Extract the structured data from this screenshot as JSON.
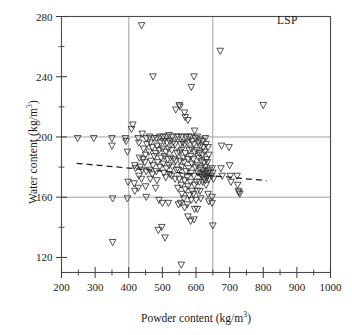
{
  "chart_data": {
    "type": "scatter",
    "title": "",
    "annotation": "LSP",
    "xlabel": "Powder content (kg/m",
    "xlabel_sup": "3",
    "xlabel_tail": ")",
    "ylabel": "Water content (kg/m",
    "ylabel_sup": "3",
    "ylabel_tail": ")",
    "xlim": [
      200,
      1000
    ],
    "ylim": [
      110,
      280
    ],
    "xticks": [
      200,
      300,
      400,
      500,
      600,
      700,
      800,
      900,
      1000
    ],
    "xticklabels": [
      "200",
      "300",
      "400",
      "500",
      "600",
      "700",
      "800",
      "900",
      "1000"
    ],
    "xminor_step": 50,
    "yticks": [
      120,
      160,
      200,
      240,
      280
    ],
    "yticklabels": [
      "120",
      "160",
      "200",
      "240",
      "280"
    ],
    "yminor_step": 20,
    "grid": true,
    "gridlines_x": [
      400,
      650
    ],
    "gridlines_y": [
      160,
      200
    ],
    "grid_color": "#999999",
    "marker": "triangle-down-open",
    "marker_color": "#333333",
    "legend": "none",
    "trendline": {
      "style": "dashed",
      "color": "#1a1a1a",
      "x": [
        245,
        810
      ],
      "y": [
        182.5,
        171.0
      ]
    },
    "points": [
      [
        248,
        199
      ],
      [
        296,
        199
      ],
      [
        350,
        199
      ],
      [
        350,
        194
      ],
      [
        352,
        159
      ],
      [
        352,
        130
      ],
      [
        390,
        199
      ],
      [
        392,
        197
      ],
      [
        396,
        190
      ],
      [
        398,
        170
      ],
      [
        396,
        159
      ],
      [
        408,
        205
      ],
      [
        412,
        208
      ],
      [
        418,
        181
      ],
      [
        420,
        179
      ],
      [
        416,
        169
      ],
      [
        418,
        164
      ],
      [
        428,
        199
      ],
      [
        430,
        196
      ],
      [
        432,
        186
      ],
      [
        434,
        180
      ],
      [
        430,
        174
      ],
      [
        428,
        166
      ],
      [
        438,
        274
      ],
      [
        440,
        202
      ],
      [
        444,
        192
      ],
      [
        442,
        185
      ],
      [
        440,
        178
      ],
      [
        438,
        172
      ],
      [
        452,
        199
      ],
      [
        454,
        195
      ],
      [
        450,
        188
      ],
      [
        448,
        183
      ],
      [
        452,
        177
      ],
      [
        450,
        167
      ],
      [
        452,
        160
      ],
      [
        462,
        200
      ],
      [
        464,
        196
      ],
      [
        460,
        190
      ],
      [
        466,
        184
      ],
      [
        462,
        178
      ],
      [
        464,
        172
      ],
      [
        472,
        240
      ],
      [
        474,
        199
      ],
      [
        470,
        193
      ],
      [
        476,
        187
      ],
      [
        472,
        181
      ],
      [
        470,
        175
      ],
      [
        482,
        199
      ],
      [
        484,
        194
      ],
      [
        480,
        189
      ],
      [
        486,
        183
      ],
      [
        482,
        177
      ],
      [
        484,
        171
      ],
      [
        480,
        166
      ],
      [
        492,
        200
      ],
      [
        494,
        196
      ],
      [
        490,
        191
      ],
      [
        496,
        186
      ],
      [
        492,
        180
      ],
      [
        490,
        158
      ],
      [
        488,
        138
      ],
      [
        502,
        200
      ],
      [
        504,
        197
      ],
      [
        500,
        192
      ],
      [
        506,
        187
      ],
      [
        502,
        182
      ],
      [
        504,
        176
      ],
      [
        500,
        156
      ],
      [
        498,
        140
      ],
      [
        512,
        200
      ],
      [
        514,
        196
      ],
      [
        510,
        190
      ],
      [
        516,
        185
      ],
      [
        512,
        179
      ],
      [
        510,
        173
      ],
      [
        508,
        133
      ],
      [
        520,
        201
      ],
      [
        522,
        197
      ],
      [
        518,
        192
      ],
      [
        524,
        186
      ],
      [
        520,
        181
      ],
      [
        522,
        175
      ],
      [
        518,
        156
      ],
      [
        530,
        200
      ],
      [
        532,
        196
      ],
      [
        528,
        191
      ],
      [
        534,
        185
      ],
      [
        530,
        180
      ],
      [
        528,
        174
      ],
      [
        540,
        218
      ],
      [
        542,
        200
      ],
      [
        538,
        195
      ],
      [
        544,
        189
      ],
      [
        540,
        184
      ],
      [
        542,
        178
      ],
      [
        538,
        172
      ],
      [
        550,
        221
      ],
      [
        552,
        220
      ],
      [
        548,
        200
      ],
      [
        554,
        195
      ],
      [
        550,
        190
      ],
      [
        552,
        184
      ],
      [
        548,
        178
      ],
      [
        550,
        172
      ],
      [
        546,
        166
      ],
      [
        548,
        155
      ],
      [
        558,
        200
      ],
      [
        560,
        196
      ],
      [
        556,
        191
      ],
      [
        562,
        186
      ],
      [
        558,
        180
      ],
      [
        560,
        174
      ],
      [
        556,
        168
      ],
      [
        558,
        162
      ],
      [
        554,
        156
      ],
      [
        556,
        115
      ],
      [
        566,
        216
      ],
      [
        568,
        213
      ],
      [
        570,
        200
      ],
      [
        566,
        195
      ],
      [
        568,
        189
      ],
      [
        564,
        183
      ],
      [
        570,
        177
      ],
      [
        566,
        171
      ],
      [
        568,
        165
      ],
      [
        564,
        159
      ],
      [
        566,
        153
      ],
      [
        576,
        211
      ],
      [
        578,
        200
      ],
      [
        574,
        196
      ],
      [
        580,
        191
      ],
      [
        576,
        185
      ],
      [
        578,
        179
      ],
      [
        574,
        173
      ],
      [
        576,
        167
      ],
      [
        580,
        161
      ],
      [
        574,
        155
      ],
      [
        576,
        147
      ],
      [
        586,
        233
      ],
      [
        584,
        200
      ],
      [
        588,
        197
      ],
      [
        586,
        192
      ],
      [
        584,
        187
      ],
      [
        588,
        182
      ],
      [
        586,
        176
      ],
      [
        584,
        170
      ],
      [
        588,
        164
      ],
      [
        586,
        158
      ],
      [
        584,
        144
      ],
      [
        594,
        240
      ],
      [
        596,
        204
      ],
      [
        598,
        199
      ],
      [
        594,
        195
      ],
      [
        596,
        190
      ],
      [
        592,
        185
      ],
      [
        598,
        180
      ],
      [
        594,
        174
      ],
      [
        596,
        168
      ],
      [
        592,
        162
      ],
      [
        596,
        152
      ],
      [
        594,
        145
      ],
      [
        604,
        200
      ],
      [
        606,
        196
      ],
      [
        602,
        191
      ],
      [
        608,
        186
      ],
      [
        604,
        181
      ],
      [
        606,
        176
      ],
      [
        602,
        170
      ],
      [
        604,
        164
      ],
      [
        600,
        158
      ],
      [
        604,
        152
      ],
      [
        612,
        198
      ],
      [
        614,
        194
      ],
      [
        610,
        189
      ],
      [
        616,
        184
      ],
      [
        612,
        179
      ],
      [
        614,
        175
      ],
      [
        610,
        170
      ],
      [
        612,
        164
      ],
      [
        614,
        159
      ],
      [
        620,
        197
      ],
      [
        622,
        193
      ],
      [
        618,
        188
      ],
      [
        624,
        183
      ],
      [
        620,
        178
      ],
      [
        622,
        176
      ],
      [
        618,
        174
      ],
      [
        624,
        172
      ],
      [
        620,
        170
      ],
      [
        628,
        199
      ],
      [
        630,
        195
      ],
      [
        626,
        190
      ],
      [
        632,
        185
      ],
      [
        628,
        180
      ],
      [
        630,
        177
      ],
      [
        626,
        175
      ],
      [
        632,
        173
      ],
      [
        628,
        171
      ],
      [
        630,
        168
      ],
      [
        636,
        193
      ],
      [
        638,
        188
      ],
      [
        634,
        183
      ],
      [
        640,
        178
      ],
      [
        636,
        176
      ],
      [
        634,
        174
      ],
      [
        638,
        172
      ],
      [
        636,
        162
      ],
      [
        638,
        157
      ],
      [
        648,
        179
      ],
      [
        650,
        176
      ],
      [
        646,
        174
      ],
      [
        652,
        172
      ],
      [
        648,
        160
      ],
      [
        650,
        141
      ],
      [
        648,
        156
      ],
      [
        672,
        257
      ],
      [
        676,
        194
      ],
      [
        674,
        179
      ],
      [
        678,
        174
      ],
      [
        698,
        193
      ],
      [
        700,
        181
      ],
      [
        702,
        174
      ],
      [
        704,
        170
      ],
      [
        722,
        174
      ],
      [
        724,
        168
      ],
      [
        726,
        164
      ],
      [
        728,
        163
      ],
      [
        730,
        162
      ],
      [
        800,
        221
      ]
    ]
  }
}
